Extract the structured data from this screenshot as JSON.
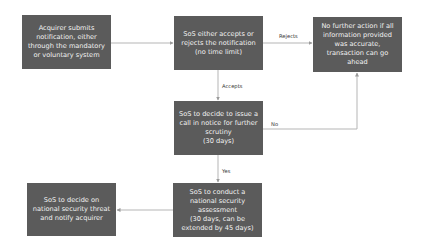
{
  "diagram": {
    "type": "flowchart",
    "colors": {
      "box_fill": "#5b5b5b",
      "box_text": "#f2f2f2",
      "connector": "#b5b5b5",
      "label_text": "#333333",
      "background": "#ffffff"
    },
    "nodes": [
      {
        "id": "n1",
        "text": "Acquirer submits\nnotification, either\nthrough the mandatory\nor voluntary system"
      },
      {
        "id": "n2",
        "text": "SoS either accepts or\nrejects the notification\n(no time limit)"
      },
      {
        "id": "n3",
        "text": "No further action if all\ninformation provided\nwas accurate,\ntransaction can go\nahead"
      },
      {
        "id": "n4",
        "text": "SoS to decide to issue a\ncall in notice for further\nscrutiny\n(30 days)"
      },
      {
        "id": "n5",
        "text": "SoS to conduct a\nnational security\nassessment\n(30 days, can be\nextended by 45 days)"
      },
      {
        "id": "n6",
        "text": "SoS to decide on\nnational security threat\nand notify acquirer"
      }
    ],
    "edges": [
      {
        "from": "n1",
        "to": "n2",
        "label": ""
      },
      {
        "from": "n2",
        "to": "n3",
        "label": "Rejects"
      },
      {
        "from": "n2",
        "to": "n4",
        "label": "Accepts"
      },
      {
        "from": "n4",
        "to": "n3",
        "label": "No"
      },
      {
        "from": "n4",
        "to": "n5",
        "label": "Yes"
      },
      {
        "from": "n5",
        "to": "n6",
        "label": ""
      }
    ]
  }
}
